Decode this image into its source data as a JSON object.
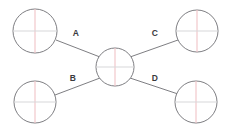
{
  "diagram": {
    "type": "hub-and-spoke-node-diagram",
    "background_color": "#ffffff",
    "stroke_color": "#6f6f74",
    "crosshair_vertical_color": "#f0c3c6",
    "crosshair_horizontal_color": "#d8d8da",
    "label_color": "#3a3a3e",
    "nodes": [
      {
        "id": "center",
        "name": "center-node",
        "label": "",
        "cx": 115,
        "cy": 67,
        "r": 19
      },
      {
        "id": "top-left",
        "name": "top-left-node",
        "label": "",
        "cx": 35,
        "cy": 31,
        "r": 22
      },
      {
        "id": "bottom-left",
        "name": "bottom-left-node",
        "label": "",
        "cx": 35,
        "cy": 102,
        "r": 21
      },
      {
        "id": "top-right",
        "name": "top-right-node",
        "label": "",
        "cx": 197,
        "cy": 31,
        "r": 21
      },
      {
        "id": "bottom-right",
        "name": "bottom-right-node",
        "label": "",
        "cx": 196,
        "cy": 102,
        "r": 21
      }
    ],
    "edges": [
      {
        "id": "edge-a",
        "label": "A",
        "from": "top-left",
        "to": "center",
        "x1": 56,
        "y1": 40,
        "x2": 100,
        "y2": 57,
        "label_x": 76,
        "label_y": 36
      },
      {
        "id": "edge-b",
        "label": "B",
        "from": "bottom-left",
        "to": "center",
        "x1": 55,
        "y1": 95,
        "x2": 100,
        "y2": 78,
        "label_x": 73,
        "label_y": 81
      },
      {
        "id": "edge-c",
        "label": "C",
        "from": "center",
        "to": "top-right",
        "x1": 130,
        "y1": 57,
        "x2": 178,
        "y2": 40,
        "label_x": 155,
        "label_y": 36
      },
      {
        "id": "edge-d",
        "label": "D",
        "from": "center",
        "to": "bottom-right",
        "x1": 130,
        "y1": 78,
        "x2": 178,
        "y2": 94,
        "label_x": 155,
        "label_y": 81
      }
    ]
  }
}
